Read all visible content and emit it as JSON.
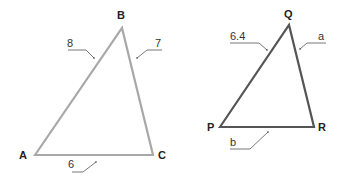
{
  "diagram": {
    "triangles": [
      {
        "name": "ABC",
        "color": "#a8a8a8",
        "vertices": {
          "A": "A",
          "B": "B",
          "C": "C"
        },
        "sides": {
          "AB": "8",
          "BC": "7",
          "AC": "6"
        }
      },
      {
        "name": "PQR",
        "color": "#555555",
        "vertices": {
          "P": "P",
          "Q": "Q",
          "R": "R"
        },
        "sides": {
          "PQ": "6.4",
          "QR": "a",
          "PR": "b"
        }
      }
    ]
  }
}
